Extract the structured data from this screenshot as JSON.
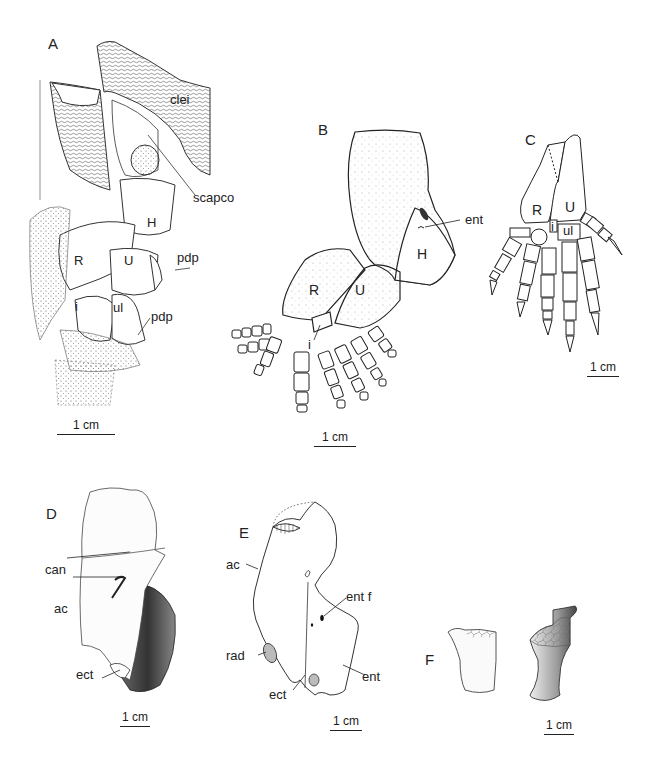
{
  "figure": {
    "panels": [
      {
        "id": "A",
        "labels": [
          "clei",
          "scapco",
          "H",
          "R",
          "U",
          "pdp",
          "i",
          "ul",
          "pdp"
        ],
        "scale_bar": "1 cm"
      },
      {
        "id": "B",
        "labels": [
          "ent",
          "H",
          "R",
          "U",
          "i"
        ],
        "scale_bar": "1 cm"
      },
      {
        "id": "C",
        "labels": [
          "R",
          "U",
          "i",
          "ul"
        ],
        "scale_bar": "1 cm"
      },
      {
        "id": "D",
        "labels": [
          "can",
          "ac",
          "ect"
        ],
        "scale_bar": "1 cm"
      },
      {
        "id": "E",
        "labels": [
          "ac",
          "ent f",
          "rad",
          "ent",
          "ect"
        ],
        "scale_bar": "1 cm"
      },
      {
        "id": "F",
        "labels": [],
        "scale_bar": "1 cm"
      }
    ]
  }
}
